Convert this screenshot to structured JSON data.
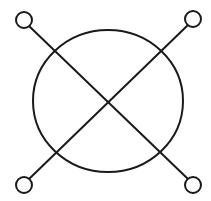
{
  "diagram": {
    "type": "symbol",
    "stroke_color": "#1a1a1a",
    "background": "#ffffff",
    "main_circle": {
      "cx": 108,
      "cy": 101,
      "rx": 75,
      "ry": 71
    },
    "terminals": [
      {
        "name": "top-left",
        "cx": 24,
        "cy": 20,
        "r": 8
      },
      {
        "name": "top-right",
        "cx": 193,
        "cy": 19,
        "r": 8
      },
      {
        "name": "bottom-left",
        "cx": 24,
        "cy": 185,
        "r": 8
      },
      {
        "name": "bottom-right",
        "cx": 193,
        "cy": 185,
        "r": 8
      }
    ],
    "lines": [
      {
        "name": "diagonal-tl-br",
        "x1": 29,
        "y1": 26,
        "x2": 188,
        "y2": 179
      },
      {
        "name": "diagonal-tr-bl",
        "x1": 188,
        "y1": 25,
        "x2": 29,
        "y2": 179
      }
    ]
  }
}
